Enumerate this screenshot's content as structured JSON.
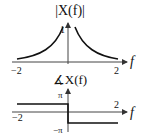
{
  "magnitude_plot": {
    "title": "|X(f)|",
    "x_axis_label": "f",
    "y_tick_label": "1",
    "x_tick_left": "−2",
    "x_tick_right": "2"
  },
  "phase_plot": {
    "title": "∡X(f)",
    "x_axis_label": "f",
    "y_tick_top": "π",
    "y_tick_bottom": "−π",
    "x_tick_left": "−2",
    "x_tick_right": "2"
  },
  "colors": {
    "line": "#111111",
    "axis": "#555555"
  }
}
